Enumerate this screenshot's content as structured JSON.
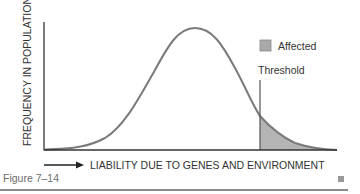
{
  "figure": {
    "caption": "Figure 7–14",
    "y_axis_label": "FREQUENCY IN POPULATION",
    "x_axis_label": "LIABILITY DUE TO GENES AND ENVIRONMENT",
    "legend": {
      "label": "Affected",
      "swatch_color": "#a9a9a9"
    },
    "threshold_label": "Threshold",
    "colors": {
      "curve": "#7a7a7a",
      "axis": "#333333",
      "shade": "#b4b4b4",
      "text": "#333333"
    }
  }
}
